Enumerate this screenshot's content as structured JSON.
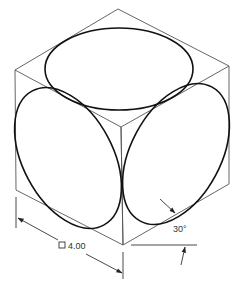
{
  "diagram": {
    "colors": {
      "background": "#ffffff",
      "cube_edges": "#555555",
      "ellipses": "#111111",
      "dimensions": "#333333"
    },
    "cube": {
      "vertices": {
        "top": [
          118,
          9
        ],
        "left": [
          15,
          70
        ],
        "right": [
          229,
          66
        ],
        "center": [
          121,
          127
        ],
        "bottom_left": [
          16,
          190
        ],
        "bottom_right": [
          229,
          184
        ],
        "bottom": [
          123,
          245
        ]
      }
    },
    "ellipses": [
      {
        "face": "top",
        "cx": 119,
        "cy": 69,
        "rx": 74,
        "ry": 41,
        "rotate": 0
      },
      {
        "face": "left",
        "cx": 68,
        "cy": 158,
        "rx": 76,
        "ry": 45,
        "rotate": 62
      },
      {
        "face": "right",
        "cx": 176,
        "cy": 154,
        "rx": 76,
        "ry": 45,
        "rotate": -62
      }
    ],
    "dimensions": {
      "size_label": "4.00",
      "size_symbol": "square",
      "angle_label": "30°"
    }
  }
}
